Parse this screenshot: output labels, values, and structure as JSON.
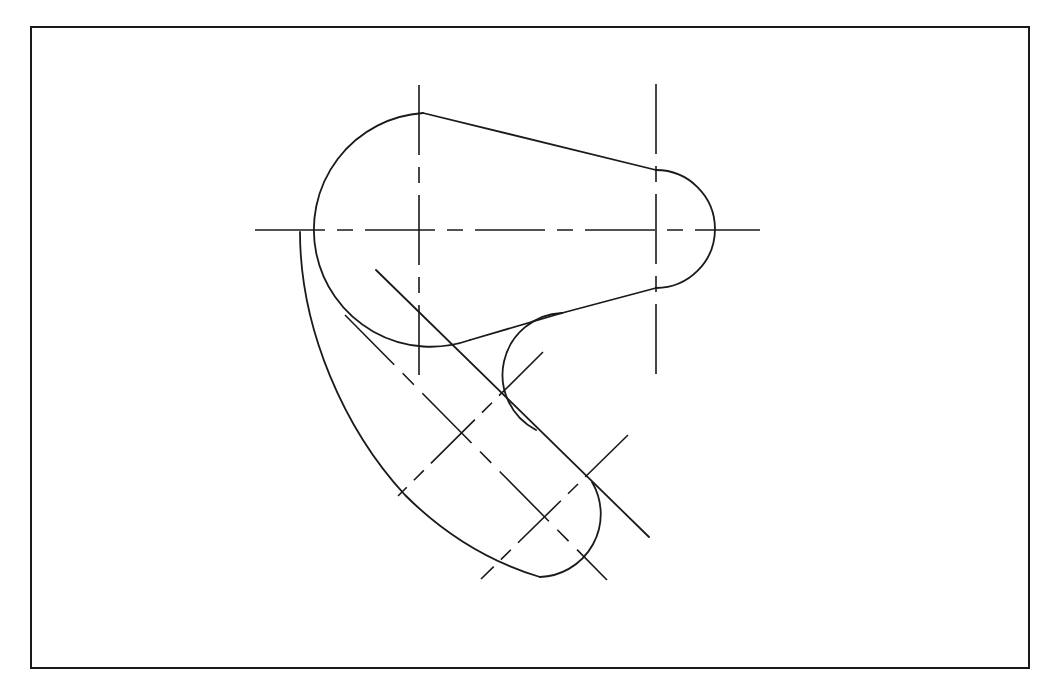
{
  "drawing": {
    "title": "Cam lever profile – technical drawing",
    "stroke_color": "#1a1a1a",
    "background_color": "#ffffff",
    "frame": {
      "x": 31,
      "y": 27,
      "width": 998,
      "height": 641
    },
    "features": {
      "large_boss": {
        "cx": 419,
        "cy": 230,
        "r": 117
      },
      "small_boss": {
        "cx": 656,
        "cy": 229,
        "r": 59
      },
      "slot_upper_center": {
        "cx": 457,
        "cy": 431
      },
      "slot_lower_center": {
        "cx": 543,
        "cy": 513
      },
      "fillet_concave": {
        "cx": 582,
        "cy": 378,
        "r": 62
      }
    },
    "centerlines": [
      {
        "name": "horizontal-main",
        "x1": 255,
        "y1": 230,
        "x2": 760,
        "y2": 230
      },
      {
        "name": "vertical-large-boss",
        "x1": 419,
        "y1": 85,
        "x2": 419,
        "y2": 375
      },
      {
        "name": "vertical-small-boss",
        "x1": 656,
        "y1": 84,
        "x2": 656,
        "y2": 375
      },
      {
        "name": "slot-axis",
        "x1": 345,
        "y1": 315,
        "x2": 607,
        "y2": 580
      },
      {
        "name": "slot-upper-cross",
        "x1": 543,
        "y1": 352,
        "x2": 398,
        "y2": 496
      },
      {
        "name": "slot-lower-cross",
        "x1": 628,
        "y1": 435,
        "x2": 481,
        "y2": 579
      }
    ]
  }
}
